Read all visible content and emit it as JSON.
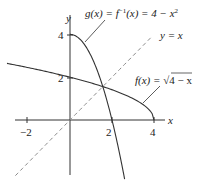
{
  "chart_data": {
    "type": "line",
    "title": "",
    "xlabel": "x",
    "ylabel": "y",
    "xlim": [
      -3.2,
      5.0
    ],
    "ylim": [
      -2.8,
      4.6
    ],
    "x_ticks": [
      -2,
      2,
      4
    ],
    "y_ticks": [
      2,
      4
    ],
    "series": [
      {
        "name": "g",
        "label": "g(x) = f⁻¹(x) = 4 − x²",
        "expr": "4 - x^2",
        "domain": [
          0,
          2.6
        ],
        "style": "solid"
      },
      {
        "name": "f",
        "label": "f(x) = √(4 − x)",
        "expr": "sqrt(4 - x)",
        "domain": [
          -3.0,
          4
        ],
        "style": "solid"
      },
      {
        "name": "identity",
        "label": "y = x",
        "expr": "x",
        "domain": [
          -2.6,
          3.9
        ],
        "style": "dashed"
      }
    ]
  },
  "labels": {
    "y_axis": "y",
    "x_axis": "x",
    "g_prefix": "g(x) = f",
    "g_sup": "−1",
    "g_mid": "(x) = 4 − x",
    "g_sup2": "2",
    "f_prefix": "f(x) = ",
    "f_radical": "√",
    "f_radicand": "4 − x",
    "identity": "y = x"
  },
  "tick_labels": {
    "xm2": "−2",
    "x2": "2",
    "x4": "4",
    "y2": "2",
    "y4": "4"
  },
  "colors": {
    "curve": "#333333",
    "axis": "#333333",
    "dashed": "#888888"
  }
}
